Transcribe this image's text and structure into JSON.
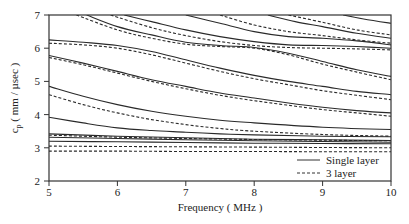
{
  "chart_data": {
    "type": "line",
    "title": "",
    "xlabel": "Frequency ( MHz )",
    "ylabel": "c_p ( mm / µsec )",
    "ylabel_parts": {
      "main": "c",
      "sub": "p",
      "rest": " ( mm / µsec )"
    },
    "xlim": [
      5,
      10
    ],
    "ylim": [
      2,
      7
    ],
    "xticks": [
      5,
      6,
      7,
      8,
      9,
      10
    ],
    "yticks": [
      2,
      3,
      4,
      5,
      6,
      7
    ],
    "grid": false,
    "legend_position": "lower right",
    "legend": [
      {
        "label": "Single layer",
        "style": "solid"
      },
      {
        "label": "3 layer",
        "style": "dashed"
      }
    ],
    "series": [
      {
        "name": "Single layer",
        "style": "solid",
        "mode": 1,
        "x": [
          5.0,
          6.0,
          7.0,
          8.0,
          9.0,
          10.0
        ],
        "y": [
          3.42,
          3.35,
          3.3,
          3.26,
          3.24,
          3.22
        ]
      },
      {
        "name": "Single layer",
        "style": "solid",
        "mode": 2,
        "x": [
          5.0,
          6.0,
          7.0,
          8.0,
          9.0,
          10.0
        ],
        "y": [
          3.32,
          3.28,
          3.24,
          3.21,
          3.19,
          3.17
        ]
      },
      {
        "name": "Single layer",
        "style": "solid",
        "mode": 3,
        "x": [
          5.0,
          6.0,
          7.0,
          8.0,
          9.0,
          10.0
        ],
        "y": [
          3.2,
          3.18,
          3.16,
          3.14,
          3.13,
          3.12
        ]
      },
      {
        "name": "Single layer",
        "style": "solid",
        "mode": 4,
        "x": [
          5.0,
          5.5,
          6.0,
          6.5,
          7.0,
          7.5,
          8.0,
          9.0,
          10.0
        ],
        "y": [
          3.92,
          3.75,
          3.6,
          3.52,
          3.47,
          3.42,
          3.39,
          3.35,
          3.33
        ]
      },
      {
        "name": "Single layer",
        "style": "solid",
        "mode": 5,
        "x": [
          5.0,
          5.5,
          6.0,
          6.5,
          7.0,
          7.5,
          8.0,
          9.0,
          10.0
        ],
        "y": [
          4.85,
          4.55,
          4.3,
          4.1,
          3.95,
          3.83,
          3.75,
          3.62,
          3.55
        ]
      },
      {
        "name": "Single layer",
        "style": "solid",
        "mode": 6,
        "x": [
          5.0,
          5.5,
          6.0,
          6.5,
          7.0,
          7.5,
          8.0,
          8.5,
          9.0,
          9.5,
          10.0
        ],
        "y": [
          5.78,
          5.55,
          5.3,
          5.05,
          4.85,
          4.65,
          4.5,
          4.35,
          4.22,
          4.12,
          4.05
        ]
      },
      {
        "name": "Single layer",
        "style": "solid",
        "mode": 7,
        "x": [
          5.0,
          5.5,
          6.0,
          6.5,
          7.0,
          7.5,
          8.0,
          8.5,
          9.0,
          9.5,
          10.0
        ],
        "y": [
          6.25,
          6.18,
          6.08,
          5.9,
          5.65,
          5.4,
          5.18,
          5.0,
          4.85,
          4.7,
          4.6
        ]
      },
      {
        "name": "Single layer",
        "style": "solid",
        "mode": 8,
        "x": [
          5.55,
          6.0,
          6.5,
          7.0,
          7.5,
          8.0,
          8.5,
          9.0,
          9.5,
          10.0
        ],
        "y": [
          7.0,
          6.65,
          6.4,
          6.18,
          6.08,
          6.02,
          5.85,
          5.6,
          5.35,
          5.15
        ]
      },
      {
        "name": "Single layer",
        "style": "solid",
        "mode": 9,
        "x": [
          6.1,
          6.5,
          7.0,
          7.5,
          8.0,
          8.5,
          9.0,
          9.5,
          10.0
        ],
        "y": [
          7.0,
          6.8,
          6.55,
          6.35,
          6.2,
          6.1,
          6.08,
          6.05,
          6.0
        ]
      },
      {
        "name": "Single layer",
        "style": "solid",
        "mode": 10,
        "x": [
          7.0,
          7.5,
          8.0,
          8.5,
          9.0,
          9.5,
          10.0
        ],
        "y": [
          7.0,
          6.75,
          6.5,
          6.35,
          6.3,
          6.22,
          6.1
        ]
      },
      {
        "name": "Single layer",
        "style": "solid",
        "mode": 11,
        "x": [
          8.2,
          8.6,
          9.0,
          9.5,
          10.0
        ],
        "y": [
          7.0,
          6.8,
          6.65,
          6.45,
          6.3
        ]
      },
      {
        "name": "Single layer",
        "style": "solid",
        "mode": 12,
        "x": [
          9.3,
          9.6,
          10.0
        ],
        "y": [
          7.0,
          6.88,
          6.75
        ]
      },
      {
        "name": "3 layer",
        "style": "dashed",
        "mode": 1,
        "x": [
          5.0,
          6.0,
          7.0,
          8.0,
          9.0,
          10.0
        ],
        "y": [
          3.38,
          3.32,
          3.28,
          3.25,
          3.23,
          3.21
        ]
      },
      {
        "name": "3 layer",
        "style": "dashed",
        "mode": 2,
        "x": [
          5.0,
          6.0,
          7.0,
          8.0,
          9.0,
          10.0
        ],
        "y": [
          3.05,
          3.04,
          3.03,
          3.02,
          3.01,
          3.0
        ]
      },
      {
        "name": "3 layer",
        "style": "dashed",
        "mode": 3,
        "x": [
          5.0,
          6.0,
          7.0,
          8.0,
          9.0,
          10.0
        ],
        "y": [
          2.9,
          2.9,
          2.89,
          2.89,
          2.88,
          2.88
        ]
      },
      {
        "name": "3 layer",
        "style": "dashed",
        "mode": 4,
        "x": [
          5.0,
          5.5,
          6.0,
          6.5,
          7.0,
          7.5,
          8.0,
          9.0,
          10.0
        ],
        "y": [
          4.6,
          4.3,
          4.05,
          3.85,
          3.7,
          3.58,
          3.5,
          3.4,
          3.35
        ]
      },
      {
        "name": "3 layer",
        "style": "dashed",
        "mode": 5,
        "x": [
          5.0,
          5.5,
          6.0,
          6.5,
          7.0,
          7.5,
          8.0,
          8.5,
          9.0,
          9.5,
          10.0
        ],
        "y": [
          5.72,
          5.5,
          5.25,
          5.0,
          4.78,
          4.58,
          4.42,
          4.28,
          4.15,
          4.05,
          3.95
        ]
      },
      {
        "name": "3 layer",
        "style": "dashed",
        "mode": 6,
        "x": [
          5.0,
          5.5,
          6.0,
          6.5,
          7.0,
          7.5,
          8.0,
          8.5,
          9.0,
          9.5,
          10.0
        ],
        "y": [
          6.15,
          6.1,
          6.0,
          5.8,
          5.55,
          5.3,
          5.08,
          4.9,
          4.72,
          4.58,
          4.45
        ]
      },
      {
        "name": "3 layer",
        "style": "dashed",
        "mode": 7,
        "x": [
          5.4,
          6.0,
          6.5,
          7.0,
          7.5,
          8.0,
          8.5,
          9.0,
          9.5,
          10.0
        ],
        "y": [
          7.0,
          6.55,
          6.3,
          6.12,
          6.05,
          6.0,
          5.8,
          5.52,
          5.28,
          5.05
        ]
      },
      {
        "name": "3 layer",
        "style": "dashed",
        "mode": 8,
        "x": [
          5.9,
          6.5,
          7.0,
          7.5,
          8.0,
          8.5,
          9.0,
          9.5,
          10.0
        ],
        "y": [
          7.0,
          6.62,
          6.38,
          6.2,
          6.08,
          6.02,
          6.0,
          5.98,
          5.95
        ]
      },
      {
        "name": "3 layer",
        "style": "dashed",
        "mode": 9,
        "x": [
          7.5,
          8.0,
          8.5,
          9.0,
          9.5,
          10.0
        ],
        "y": [
          7.0,
          6.7,
          6.5,
          6.38,
          6.25,
          6.15
        ]
      },
      {
        "name": "3 layer",
        "style": "dashed",
        "mode": 10,
        "x": [
          8.5,
          9.0,
          9.5,
          10.0
        ],
        "y": [
          7.0,
          6.78,
          6.55,
          6.4
        ]
      }
    ]
  }
}
